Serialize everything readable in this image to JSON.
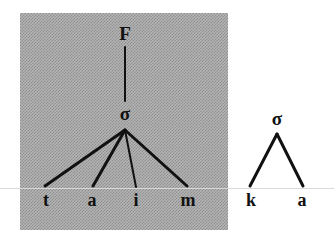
{
  "figure": {
    "caption_text": "",
    "background_color": "#ffffff",
    "shaded_panel": {
      "name": "shaded-region",
      "fill_color": "#b4b4b4",
      "dither_color": "#8f8f8f",
      "x": 20,
      "y": 13,
      "width": 208,
      "height": 217
    },
    "baseline_rule": {
      "color": "#d9d9d9",
      "y": 188
    },
    "stroke_color": "#111111"
  },
  "trees": [
    {
      "id": "foot-tree",
      "name": "foot-tree-taim",
      "inside_shaded_panel": true,
      "nodes": [
        {
          "id": "F",
          "label": "F",
          "x": 125,
          "y": 33,
          "size": "root"
        },
        {
          "id": "S1",
          "label": "σ",
          "x": 125,
          "y": 113,
          "size": "sigma"
        },
        {
          "id": "L1",
          "label": "t",
          "x": 46,
          "y": 200,
          "size": "leaf"
        },
        {
          "id": "L2",
          "label": "a",
          "x": 92,
          "y": 200,
          "size": "leaf"
        },
        {
          "id": "L3",
          "label": "i",
          "x": 136,
          "y": 200,
          "size": "leaf"
        },
        {
          "id": "L4",
          "label": "m",
          "x": 188,
          "y": 200,
          "size": "leaf"
        }
      ],
      "edges": [
        {
          "from": "F",
          "to": "S1",
          "x1": 125,
          "y1": 47,
          "x2": 125,
          "y2": 101,
          "width": 2
        },
        {
          "from": "S1",
          "to": "L1",
          "x1": 125,
          "y1": 130,
          "x2": 45,
          "y2": 186,
          "width": 3
        },
        {
          "from": "S1",
          "to": "L2",
          "x1": 125,
          "y1": 130,
          "x2": 93,
          "y2": 186,
          "width": 3
        },
        {
          "from": "S1",
          "to": "L3",
          "x1": 125,
          "y1": 130,
          "x2": 136,
          "y2": 187,
          "width": 2
        },
        {
          "from": "S1",
          "to": "L4",
          "x1": 125,
          "y1": 130,
          "x2": 187,
          "y2": 186,
          "width": 3
        }
      ]
    },
    {
      "id": "syllable-tree",
      "name": "syllable-tree-ka",
      "inside_shaded_panel": false,
      "nodes": [
        {
          "id": "S2",
          "label": "σ",
          "x": 277,
          "y": 118,
          "size": "sigma"
        },
        {
          "id": "R1",
          "label": "k",
          "x": 251,
          "y": 200,
          "size": "leaf"
        },
        {
          "id": "R2",
          "label": "a",
          "x": 302,
          "y": 200,
          "size": "leaf"
        }
      ],
      "edges": [
        {
          "from": "S2",
          "to": "R1",
          "x1": 277,
          "y1": 134,
          "x2": 250,
          "y2": 186,
          "width": 3
        },
        {
          "from": "S2",
          "to": "R2",
          "x1": 277,
          "y1": 134,
          "x2": 303,
          "y2": 186,
          "width": 3
        }
      ]
    }
  ]
}
